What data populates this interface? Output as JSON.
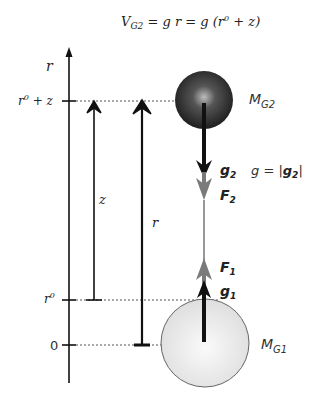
{
  "diagram": {
    "equation": {
      "lhs": "V",
      "lhs_sub": "G2",
      "rhs": " = g r = g (r",
      "rhs_sup": "0",
      "rhs_tail": " + z)"
    },
    "axis": {
      "label": "r",
      "ticks": [
        {
          "label": "r",
          "sup": "0",
          "tail": " + z"
        },
        {
          "label": "r",
          "sup": "0",
          "tail": ""
        },
        {
          "label": "0",
          "sup": "",
          "tail": ""
        }
      ]
    },
    "arrows": {
      "z_label": "z",
      "r_label": "r"
    },
    "masses": {
      "top": {
        "label": "M",
        "sub": "G2"
      },
      "bottom": {
        "label": "M",
        "sub": "G1"
      }
    },
    "vectors": {
      "g2": {
        "label": "g",
        "sub": "2"
      },
      "F2": {
        "label": "F",
        "sub": "2"
      },
      "F1": {
        "label": "F",
        "sub": "1"
      },
      "g1": {
        "label": "g",
        "sub": "1"
      },
      "g_def": {
        "lhs": "g = |",
        "vec": "g",
        "sub": "2",
        "tail": "|"
      }
    },
    "colors": {
      "dark_sphere": "#2a2a2a",
      "light_sphere": "#e6e6e6",
      "force_gray": "#7a7a7a",
      "line": "#111111"
    }
  }
}
